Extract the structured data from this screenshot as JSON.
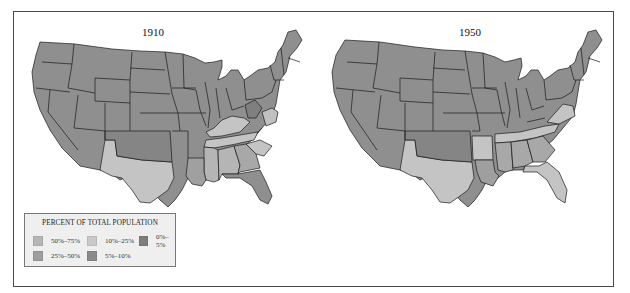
{
  "maps": [
    {
      "title": "1910",
      "regions": {
        "base": "25%–50%",
        "texas": "10%–25%",
        "kentucky": "10%–25%",
        "tennessee": "10%–25%",
        "deep_south": "10%–25%",
        "south_carolina": "10%–25%",
        "florida": "5%–10%",
        "oklahoma": "5%–10%",
        "virginia_coast": "10%–25%"
      }
    },
    {
      "title": "1950",
      "regions": {
        "base": "25%–50%",
        "texas": "10%–25%",
        "arkansas": "10%–25%",
        "tennessee": "10%–25%",
        "virginia": "10%–25%",
        "florida": "10%–25%",
        "deep_south": "10%–25%",
        "oklahoma": "5%–10%"
      }
    }
  ],
  "legend": {
    "title": "PERCENT OF TOTAL POPULATION",
    "items": [
      {
        "label": "50%–75%",
        "color": "#b6b6b6"
      },
      {
        "label": "10%–25%",
        "color": "#c9c9c9"
      },
      {
        "label": "0%–5%",
        "color": "#7e7e7e"
      },
      {
        "label": "25%–50%",
        "color": "#9f9f9f"
      },
      {
        "label": "5%–10%",
        "color": "#8a8a8a"
      }
    ]
  },
  "colors": {
    "base_state": "#8f8f8f",
    "light_state": "#c4c4c4",
    "mid_state": "#a8a8a8",
    "dark_state": "#858585",
    "border": "#1a1a1a",
    "frame": "#4a4a4a"
  }
}
